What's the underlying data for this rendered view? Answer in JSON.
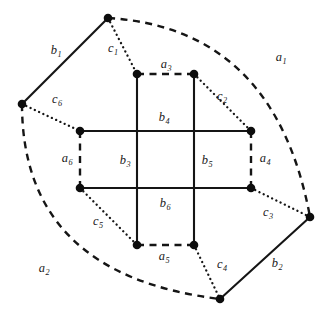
{
  "figure": {
    "background_color": "#ffffff",
    "stroke_color": "#151515",
    "width": 325,
    "height": 326
  },
  "vertices": [
    {
      "id": "v_top",
      "name": "outer-vertex-top",
      "x": 108,
      "y": 18
    },
    {
      "id": "v_left",
      "name": "outer-vertex-left",
      "x": 22,
      "y": 104
    },
    {
      "id": "v_right",
      "name": "outer-vertex-right",
      "x": 310,
      "y": 217
    },
    {
      "id": "v_bottom",
      "name": "outer-vertex-bottom",
      "x": 220,
      "y": 299
    },
    {
      "id": "i_tl",
      "name": "inner-vertex-top-left",
      "x": 137,
      "y": 74
    },
    {
      "id": "i_tr",
      "name": "inner-vertex-top-right",
      "x": 194,
      "y": 74
    },
    {
      "id": "i_lt",
      "name": "inner-vertex-left-top",
      "x": 80,
      "y": 131
    },
    {
      "id": "i_rt",
      "name": "inner-vertex-right-top",
      "x": 251,
      "y": 131
    },
    {
      "id": "i_lb",
      "name": "inner-vertex-left-bottom",
      "x": 80,
      "y": 188
    },
    {
      "id": "i_rb",
      "name": "inner-vertex-right-bottom",
      "x": 251,
      "y": 188
    },
    {
      "id": "i_bl",
      "name": "inner-vertex-bottom-left",
      "x": 137,
      "y": 245
    },
    {
      "id": "i_br",
      "name": "inner-vertex-bottom-right",
      "x": 194,
      "y": 245
    }
  ],
  "edges": [
    {
      "id": "a1",
      "label": "a",
      "sub": "1",
      "style": "dashed",
      "from": "v_top",
      "to": "v_right",
      "label_x": 281,
      "label_y": 57
    },
    {
      "id": "a2",
      "label": "a",
      "sub": "2",
      "style": "dashed",
      "from": "v_left",
      "to": "v_bottom",
      "label_x": 44,
      "label_y": 268
    },
    {
      "id": "a3",
      "label": "a",
      "sub": "3",
      "style": "dashed",
      "from": "i_tl",
      "to": "i_tr",
      "label_x": 166,
      "label_y": 64
    },
    {
      "id": "a4",
      "label": "a",
      "sub": "4",
      "style": "dashed",
      "from": "i_rt",
      "to": "i_rb",
      "label_x": 265,
      "label_y": 158
    },
    {
      "id": "a5",
      "label": "a",
      "sub": "5",
      "style": "dashed",
      "from": "i_bl",
      "to": "i_br",
      "label_x": 164,
      "label_y": 256
    },
    {
      "id": "a6",
      "label": "a",
      "sub": "6",
      "style": "dashed",
      "from": "i_lt",
      "to": "i_lb",
      "label_x": 67,
      "label_y": 158
    },
    {
      "id": "b1",
      "label": "b",
      "sub": "1",
      "style": "solid",
      "from": "v_left",
      "to": "v_top",
      "label_x": 56,
      "label_y": 50
    },
    {
      "id": "b2",
      "label": "b",
      "sub": "2",
      "style": "solid",
      "from": "v_bottom",
      "to": "v_right",
      "label_x": 277,
      "label_y": 263
    },
    {
      "id": "b3",
      "label": "b",
      "sub": "3",
      "style": "solid",
      "from": "i_tl",
      "to": "i_bl",
      "label_x": 125,
      "label_y": 160
    },
    {
      "id": "b4",
      "label": "b",
      "sub": "4",
      "style": "solid",
      "from": "i_lt",
      "to": "i_rt",
      "label_x": 164,
      "label_y": 117
    },
    {
      "id": "b5",
      "label": "b",
      "sub": "5",
      "style": "solid",
      "from": "i_tr",
      "to": "i_br",
      "label_x": 207,
      "label_y": 160
    },
    {
      "id": "b6",
      "label": "b",
      "sub": "6",
      "style": "solid",
      "from": "i_lb",
      "to": "i_rb",
      "label_x": 165,
      "label_y": 203
    },
    {
      "id": "c1",
      "label": "c",
      "sub": "1",
      "style": "dotted",
      "from": "v_top",
      "to": "i_tl",
      "label_x": 113,
      "label_y": 48
    },
    {
      "id": "c2",
      "label": "c",
      "sub": "2",
      "style": "dotted",
      "from": "i_tr",
      "to": "i_rt",
      "label_x": 222,
      "label_y": 96
    },
    {
      "id": "c3",
      "label": "c",
      "sub": "3",
      "style": "dotted",
      "from": "i_rb",
      "to": "v_right",
      "label_x": 268,
      "label_y": 212
    },
    {
      "id": "c4",
      "label": "c",
      "sub": "4",
      "style": "dotted",
      "from": "i_br",
      "to": "v_bottom",
      "label_x": 222,
      "label_y": 264
    },
    {
      "id": "c5",
      "label": "c",
      "sub": "5",
      "style": "dotted",
      "from": "i_lb",
      "to": "i_bl",
      "label_x": 98,
      "label_y": 221
    },
    {
      "id": "c6",
      "label": "c",
      "sub": "6",
      "style": "dotted",
      "from": "v_left",
      "to": "i_lt",
      "label_x": 57,
      "label_y": 99
    }
  ],
  "arcs": {
    "a1_path": "M 108 18 Q 275 28 310 217",
    "a2_path": "M 22 104 Q 22 275 220 299"
  }
}
